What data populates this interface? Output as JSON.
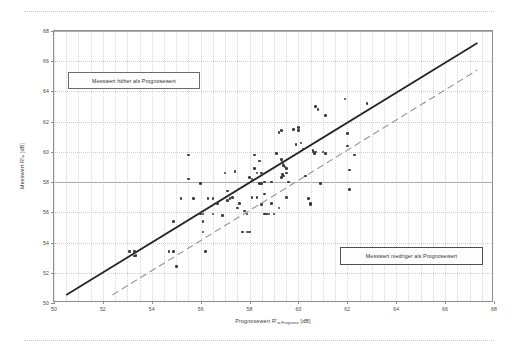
{
  "chart_data": {
    "type": "scatter",
    "title": "",
    "xlabel": "Prognosewert R'w,Prognose [dB]",
    "ylabel": "Messwert R'w [dB]",
    "xlabel_main": "Prognosewert R'",
    "xlabel_sub": "w,Prognose",
    "xlabel_unit": " [dB]",
    "ylabel_main": "Messwert R'",
    "ylabel_sub": "w",
    "ylabel_unit": " [dB]",
    "xlim": [
      50,
      68
    ],
    "ylim": [
      50,
      68
    ],
    "xticks": [
      50,
      52,
      54,
      56,
      58,
      60,
      62,
      64,
      66,
      68
    ],
    "yticks": [
      50,
      52,
      54,
      56,
      58,
      60,
      62,
      64,
      66,
      68
    ],
    "xtick_labels": [
      "50",
      "52",
      "54",
      "56",
      "58",
      "60",
      "62",
      "64",
      "66",
      "68"
    ],
    "ytick_labels": [
      "50",
      "52",
      "54",
      "56",
      "58",
      "60",
      "62",
      "64",
      "66",
      "68"
    ],
    "xminor_step": 0.5,
    "grid": true,
    "grid_major_y": [
      58,
      68
    ],
    "legend": "none",
    "series": [
      {
        "name": "Messwert vs. Prognosewert",
        "marker": "filled-circle",
        "color": "#3a3a3a",
        "points": [
          [
            55.5,
            59.8
          ],
          [
            55.5,
            58.2
          ],
          [
            56.0,
            57.9
          ],
          [
            55.2,
            56.9
          ],
          [
            55.7,
            56.9
          ],
          [
            56.3,
            56.9
          ],
          [
            56.5,
            56.9
          ],
          [
            54.9,
            55.4
          ],
          [
            56.0,
            55.9
          ],
          [
            56.1,
            55.9
          ],
          [
            56.1,
            55.4
          ],
          [
            56.2,
            53.4
          ],
          [
            55.0,
            52.4
          ],
          [
            56.1,
            54.7
          ],
          [
            53.1,
            53.4
          ],
          [
            53.3,
            53.4
          ],
          [
            53.3,
            53.1
          ],
          [
            53.35,
            53.15
          ],
          [
            54.7,
            53.4
          ],
          [
            54.9,
            53.4
          ],
          [
            57.0,
            58.6
          ],
          [
            57.1,
            57.4
          ],
          [
            57.2,
            56.9
          ],
          [
            57.1,
            56.8
          ],
          [
            56.9,
            55.8
          ],
          [
            57.3,
            57.0
          ],
          [
            57.7,
            54.7
          ],
          [
            57.9,
            54.7
          ],
          [
            58.0,
            54.7
          ],
          [
            57.6,
            56.6
          ],
          [
            57.9,
            55.9
          ],
          [
            57.8,
            56.1
          ],
          [
            58.2,
            59.8
          ],
          [
            58.2,
            58.9
          ],
          [
            58.3,
            58.6
          ],
          [
            58.0,
            58.3
          ],
          [
            58.1,
            58.2
          ],
          [
            58.4,
            59.4
          ],
          [
            58.5,
            58.6
          ],
          [
            58.4,
            57.9
          ],
          [
            58.5,
            57.9
          ],
          [
            58.6,
            58.0
          ],
          [
            58.3,
            57.0
          ],
          [
            58.5,
            56.5
          ],
          [
            58.6,
            55.9
          ],
          [
            58.7,
            55.9
          ],
          [
            58.9,
            56.6
          ],
          [
            58.9,
            58.0
          ],
          [
            58.6,
            57.2
          ],
          [
            59.2,
            83.4
          ],
          [
            59.2,
            61.3
          ],
          [
            59.3,
            61.4
          ],
          [
            59.1,
            59.9
          ],
          [
            59.3,
            59.5
          ],
          [
            59.35,
            59.3
          ],
          [
            59.4,
            59.1
          ],
          [
            59.45,
            59.0
          ],
          [
            59.5,
            58.9
          ],
          [
            59.5,
            58.6
          ],
          [
            59.4,
            58.4
          ],
          [
            59.35,
            58.5
          ],
          [
            59.3,
            58.3
          ],
          [
            59.6,
            58.0
          ],
          [
            59.5,
            57.0
          ],
          [
            59.2,
            56.3
          ],
          [
            59.8,
            61.5
          ],
          [
            60.0,
            61.6
          ],
          [
            60.0,
            61.4
          ],
          [
            60.1,
            60.6
          ],
          [
            59.9,
            60.5
          ],
          [
            60.2,
            60.2
          ],
          [
            60.3,
            58.4
          ],
          [
            60.4,
            56.9
          ],
          [
            60.5,
            56.5
          ],
          [
            60.5,
            56.6
          ],
          [
            60.6,
            60.0
          ],
          [
            60.7,
            60.0
          ],
          [
            60.65,
            59.9
          ],
          [
            60.6,
            60.1
          ],
          [
            60.7,
            63.0
          ],
          [
            60.8,
            62.8
          ],
          [
            61.0,
            60.0
          ],
          [
            61.1,
            62.4
          ],
          [
            61.1,
            59.9
          ],
          [
            61.9,
            63.5
          ],
          [
            62.0,
            61.2
          ],
          [
            62.0,
            60.4
          ],
          [
            62.1,
            58.8
          ],
          [
            62.3,
            59.8
          ],
          [
            62.1,
            57.5
          ],
          [
            62.8,
            63.2
          ],
          [
            60.9,
            57.9
          ],
          [
            57.4,
            58.7
          ],
          [
            58.8,
            55.9
          ],
          [
            59.0,
            55.9
          ],
          [
            57.5,
            56.3
          ],
          [
            56.5,
            55.9
          ],
          [
            56.7,
            56.6
          ],
          [
            58.1,
            57.0
          ]
        ]
      }
    ],
    "reference_lines": [
      {
        "name": "ideal-1-to-1",
        "style": "solid",
        "color": "#252525",
        "width": 1.8,
        "from": [
          50.5,
          50.4
        ],
        "to": [
          67.4,
          67.2
        ],
        "description": "Messwert = Prognosewert (Winkelhalbierende)"
      },
      {
        "name": "offset-lower-bound",
        "style": "dashed",
        "color": "#9b9b9b",
        "width": 1.2,
        "from": [
          52.4,
          50.4
        ],
        "to": [
          67.4,
          65.4
        ],
        "description": "Messwert = Prognosewert - 2 dB"
      }
    ],
    "annotations": [
      {
        "name": "callout-higher",
        "text": "Messwert höher als Prognosewert",
        "region": "upper-left"
      },
      {
        "name": "callout-lower",
        "text": "Messwert niedriger als Prognosewert",
        "region": "lower-right"
      }
    ]
  },
  "annotations": {
    "higher": "Messwert höher als Prognosewert",
    "lower": "Messwert niedriger als Prognosewert"
  },
  "colors": {
    "point": "#3a3a3a",
    "ideal_line": "#252525",
    "offset_line": "#9b9b9b",
    "grid": "#cfcfcf",
    "axis": "#8f8f8f"
  }
}
